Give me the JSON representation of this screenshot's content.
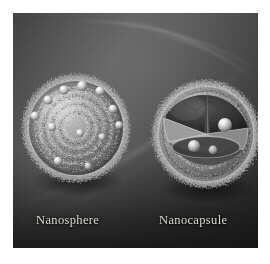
{
  "figure": {
    "background_color": "#4a4a4a",
    "mount_color": "#ffffff",
    "caption_color": "#ded9d2"
  },
  "particles": [
    {
      "id": "nanosphere",
      "label": "Nanosphere",
      "description": "solid rough-surfaced sphere with bright drug spheres embedded over the outer surface"
    },
    {
      "id": "nanocapsule",
      "label": "Nanocapsule",
      "description": "cutaway sphere with hollow core, shell wall and bright spheres inside the cavity"
    }
  ],
  "captions": {
    "left": "Nanosphere",
    "right": "Nanocapsule"
  }
}
